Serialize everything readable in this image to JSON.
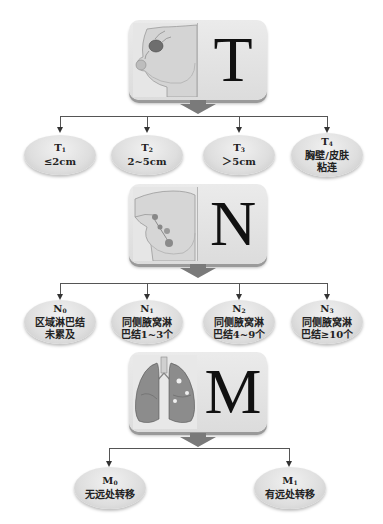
{
  "sections": {
    "t": {
      "letter": "T",
      "image": "breast-tumor-illustration",
      "nodes": [
        {
          "code": "T",
          "sub": "1",
          "lines": [
            "≤2cm"
          ]
        },
        {
          "code": "T",
          "sub": "2",
          "lines": [
            "2~5cm"
          ]
        },
        {
          "code": "T",
          "sub": "3",
          "lines": [
            "＞5cm"
          ]
        },
        {
          "code": "T",
          "sub": "4",
          "lines": [
            "胸壁/皮肤",
            "粘连"
          ]
        }
      ]
    },
    "n": {
      "letter": "N",
      "image": "axillary-lymph-node-illustration",
      "nodes": [
        {
          "code": "N",
          "sub": "0",
          "lines": [
            "区域淋巴结",
            "未累及"
          ]
        },
        {
          "code": "N",
          "sub": "1",
          "lines": [
            "同侧腋窝淋",
            "巴结1~3个"
          ]
        },
        {
          "code": "N",
          "sub": "2",
          "lines": [
            "同侧腋窝淋",
            "巴结4~9个"
          ]
        },
        {
          "code": "N",
          "sub": "3",
          "lines": [
            "同侧腋窝淋",
            "巴结≥10个"
          ]
        }
      ]
    },
    "m": {
      "letter": "M",
      "image": "lungs-metastasis-illustration",
      "nodes": [
        {
          "code": "M",
          "sub": "0",
          "lines": [
            "无远处转移"
          ]
        },
        {
          "code": "M",
          "sub": "1",
          "lines": [
            "有远处转移"
          ]
        }
      ]
    }
  },
  "colors": {
    "card_bg": "#e4e4e4",
    "arrow": "#7a7a7a",
    "connector": "#555555",
    "oval": "#dedede",
    "text": "#222222"
  }
}
